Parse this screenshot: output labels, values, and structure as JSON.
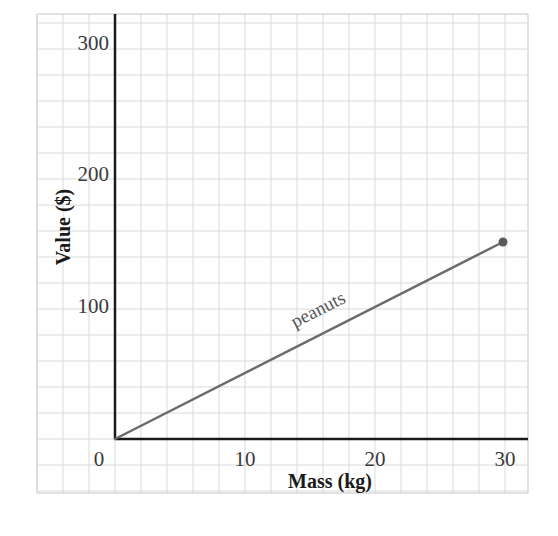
{
  "chart_data": {
    "type": "line",
    "title": "",
    "xlabel": "Mass (kg)",
    "ylabel": "Value ($)",
    "xlim": [
      0,
      30
    ],
    "ylim": [
      0,
      300
    ],
    "x_ticks": [
      0,
      10,
      20,
      30
    ],
    "y_ticks": [
      100,
      200,
      300
    ],
    "x_tick_labels": [
      "0",
      "10",
      "20",
      "30"
    ],
    "y_tick_labels": [
      "100",
      "200",
      "300"
    ],
    "grid": true,
    "grid_minor_x_step": 2,
    "grid_minor_y_step": 20,
    "legend": "none (inline label on line)",
    "series": [
      {
        "name": "peanuts",
        "x": [
          0,
          30
        ],
        "y": [
          0,
          150
        ],
        "color": "#6b6b6b",
        "end_marker": "filled circle at (30, 150)"
      }
    ]
  },
  "colors": {
    "grid": "#d9d9d9",
    "axis": "#1a1a1a",
    "series": "#6b6b6b",
    "tick_text": "#3a3a3a"
  }
}
